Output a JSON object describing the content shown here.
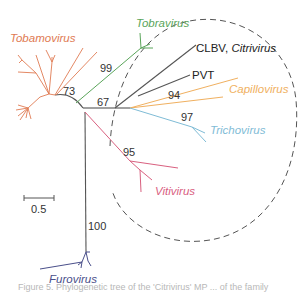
{
  "figure": {
    "type": "unrooted phylogenetic tree",
    "clades": [
      {
        "name": "Tobamovirus",
        "color": "#e07a52",
        "italic": true
      },
      {
        "name": "Tobravirus",
        "color": "#5aa55a",
        "italic": true
      },
      {
        "name": "CLBV, Citrivirus",
        "prefix": "CLBV, ",
        "italic_part": "Citrivirus",
        "color": "#333333"
      },
      {
        "name": "PVT",
        "color": "#333333",
        "italic": false
      },
      {
        "name": "Capillovirus",
        "color": "#f0b060",
        "italic": true
      },
      {
        "name": "Trichovirus",
        "color": "#7fbcd6",
        "italic": true
      },
      {
        "name": "Vitivirus",
        "color": "#d9607f",
        "italic": true
      },
      {
        "name": "Furovirus",
        "color": "#4a4f8a",
        "italic": true
      }
    ],
    "bootstrap_values": [
      "73",
      "99",
      "67",
      "94",
      "97",
      "95",
      "100"
    ],
    "scale_bar": {
      "label": "0.5"
    },
    "highlight": {
      "shape": "dashed ellipse",
      "color": "#555555"
    },
    "caption_partial": "Figure 5. Phylogenetic tree of the 'Citrivirus' MP ... of the family"
  },
  "labels": {
    "tobamovirus": "Tobamovirus",
    "tobravirus": "Tobravirus",
    "clbv_prefix": "CLBV,",
    "citrivirus": "Citrivirus",
    "pvt": "PVT",
    "capillovirus": "Capillovirus",
    "trichovirus": "Trichovirus",
    "vitivirus": "Vitivirus",
    "furovirus": "Furovirus",
    "scale": "0.5",
    "b73": "73",
    "b99": "99",
    "b67": "67",
    "b94": "94",
    "b97": "97",
    "b95": "95",
    "b100": "100"
  }
}
